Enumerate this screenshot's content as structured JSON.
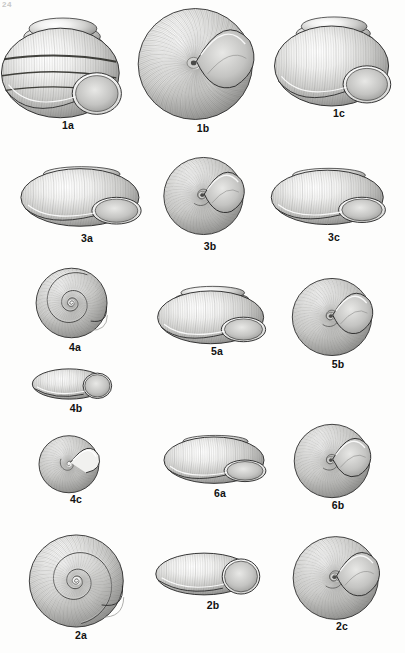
{
  "plate": {
    "page_mark": "24",
    "background_color": "#fdfdfc",
    "ink_color": "#2b2b2b",
    "label_color": "#111111",
    "medium": "grayscale stipple illustration",
    "subject": "land snail shells",
    "figure_count": 15
  },
  "figures": [
    {
      "id": "1a",
      "label": "1a",
      "view": "apertural view",
      "form": "conical-globose shell with dark spiral bands",
      "x": 4,
      "y": 8,
      "w": 128,
      "h": 112,
      "label_x": 4,
      "label_y": 119,
      "label_w": 128
    },
    {
      "id": "1b",
      "label": "1b",
      "view": "basal/umbilical view",
      "form": "rounded shell with crescent aperture",
      "x": 139,
      "y": 5,
      "w": 128,
      "h": 118,
      "label_x": 139,
      "label_y": 122,
      "label_w": 128
    },
    {
      "id": "1c",
      "label": "1c",
      "view": "apertural view",
      "form": "conical-globose shell, pale banding",
      "x": 277,
      "y": 8,
      "w": 124,
      "h": 100,
      "label_x": 277,
      "label_y": 107,
      "label_w": 124
    },
    {
      "id": "3a",
      "label": "3a",
      "view": "apertural view",
      "form": "depressed shell with flared aperture",
      "x": 28,
      "y": 160,
      "w": 118,
      "h": 72,
      "label_x": 28,
      "label_y": 232,
      "label_w": 118
    },
    {
      "id": "3b",
      "label": "3b",
      "view": "umbilical view",
      "form": "globose shell with deep umbilicus",
      "x": 156,
      "y": 155,
      "w": 108,
      "h": 82,
      "label_x": 156,
      "label_y": 240,
      "label_w": 108
    },
    {
      "id": "3c",
      "label": "3c",
      "view": "apical view",
      "form": "low-spired flattened shell",
      "x": 278,
      "y": 162,
      "w": 112,
      "h": 68,
      "label_x": 278,
      "label_y": 231,
      "label_w": 112
    },
    {
      "id": "4a",
      "label": "4a",
      "view": "apical view",
      "form": "flat discoidal shell, tight spiral",
      "x": 32,
      "y": 266,
      "w": 86,
      "h": 74,
      "label_x": 32,
      "label_y": 341,
      "label_w": 86
    },
    {
      "id": "4b",
      "label": "4b",
      "view": "apertural view",
      "form": "low shell with rounded aperture",
      "x": 34,
      "y": 363,
      "w": 84,
      "h": 42,
      "label_x": 34,
      "label_y": 402,
      "label_w": 84
    },
    {
      "id": "4c",
      "label": "4c",
      "view": "basal view",
      "form": "globose shell, reflected lip",
      "x": 32,
      "y": 432,
      "w": 88,
      "h": 62,
      "label_x": 32,
      "label_y": 493,
      "label_w": 88
    },
    {
      "id": "5a",
      "label": "5a",
      "view": "apertural view",
      "form": "broadly conical shell, wide aperture",
      "x": 164,
      "y": 283,
      "w": 106,
      "h": 66,
      "label_x": 164,
      "label_y": 345,
      "label_w": 106
    },
    {
      "id": "5b",
      "label": "5b",
      "view": "umbilical view",
      "form": "rounded shell, radial striations",
      "x": 288,
      "y": 276,
      "w": 100,
      "h": 82,
      "label_x": 288,
      "label_y": 358,
      "label_w": 100
    },
    {
      "id": "6a",
      "label": "6a",
      "view": "apertural view",
      "form": "depressed shell, expanded aperture",
      "x": 170,
      "y": 430,
      "w": 100,
      "h": 58,
      "label_x": 170,
      "label_y": 487,
      "label_w": 100
    },
    {
      "id": "6b",
      "label": "6b",
      "view": "umbilical view",
      "form": "globose shell with spiral nucleus",
      "x": 288,
      "y": 422,
      "w": 100,
      "h": 78,
      "label_x": 288,
      "label_y": 499,
      "label_w": 100
    },
    {
      "id": "2a",
      "label": "2a",
      "view": "apical view",
      "form": "large discoidal shell, broad whorls",
      "x": 22,
      "y": 532,
      "w": 118,
      "h": 98,
      "label_x": 22,
      "label_y": 629,
      "label_w": 118
    },
    {
      "id": "2b",
      "label": "2b",
      "view": "apertural view",
      "form": "flattened shell, elongate aperture",
      "x": 158,
      "y": 545,
      "w": 110,
      "h": 58,
      "label_x": 158,
      "label_y": 599,
      "label_w": 110
    },
    {
      "id": "2c",
      "label": "2c",
      "view": "umbilical view",
      "form": "discoidal shell with extended lip",
      "x": 290,
      "y": 534,
      "w": 104,
      "h": 88,
      "label_x": 290,
      "label_y": 620,
      "label_w": 104
    }
  ]
}
